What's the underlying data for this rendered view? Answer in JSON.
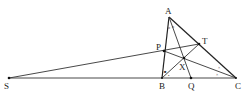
{
  "diagram": {
    "type": "geometry",
    "points": {
      "A": {
        "label": "A",
        "x": 169,
        "y": 17,
        "lx": 166,
        "ly": 14
      },
      "B": {
        "label": "B",
        "x": 162,
        "y": 78,
        "lx": 160,
        "ly": 89
      },
      "C": {
        "label": "C",
        "x": 236,
        "y": 78,
        "lx": 235,
        "ly": 89
      },
      "S": {
        "label": "S",
        "x": 9,
        "y": 78,
        "lx": 5,
        "ly": 89
      },
      "P": {
        "label": "P",
        "x": 164,
        "y": 51,
        "lx": 156,
        "ly": 49
      },
      "T": {
        "label": "T",
        "x": 199,
        "y": 44,
        "lx": 203,
        "ly": 43
      },
      "Q": {
        "label": "Q",
        "x": 191,
        "y": 78,
        "lx": 188,
        "ly": 89
      },
      "X": {
        "label": "X",
        "x": 184,
        "y": 58,
        "lx": 179,
        "ly": 70
      }
    },
    "segments": [
      [
        "A",
        "B"
      ],
      [
        "A",
        "C"
      ],
      [
        "S",
        "C"
      ],
      [
        "S",
        "T"
      ],
      [
        "P",
        "C"
      ],
      [
        "B",
        "T"
      ],
      [
        "A",
        "Q"
      ]
    ],
    "angle_marks": {
      "at_A": "o o",
      "at_B": "• •",
      "at_C": "× ×"
    }
  }
}
